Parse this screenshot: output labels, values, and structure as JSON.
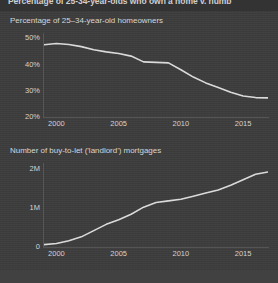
{
  "header": {
    "title": "Percentage of 25-34-year-olds who own a home v. numb"
  },
  "colors": {
    "background": "#3c3c3c",
    "header_band": "#333333",
    "line": "#dcdcdc",
    "axis": "#555555",
    "text": "#d4d4d4"
  },
  "chart_data": [
    {
      "type": "line",
      "title": "Percentage of 25–34-year-old homeowners",
      "xlabel": "",
      "ylabel": "",
      "xlim": [
        1999,
        2017
      ],
      "ylim": [
        20,
        52
      ],
      "xticks": [
        "2000",
        "2005",
        "2010",
        "2015"
      ],
      "xtick_values": [
        2000,
        2005,
        2010,
        2015
      ],
      "yticks": [
        "50%",
        "40%",
        "30%",
        "20%"
      ],
      "ytick_values": [
        50,
        40,
        30,
        20
      ],
      "grid": false,
      "legend": "none",
      "x": [
        1999,
        2000,
        2001,
        2002,
        2003,
        2004,
        2005,
        2006,
        2007,
        2008,
        2009,
        2010,
        2011,
        2012,
        2013,
        2014,
        2015,
        2016,
        2017
      ],
      "values": [
        47.5,
        48.0,
        47.6,
        46.8,
        45.6,
        44.8,
        44.2,
        43.2,
        41.0,
        40.8,
        40.6,
        38.0,
        35.2,
        33.0,
        31.2,
        29.4,
        28.0,
        27.4,
        27.3
      ]
    },
    {
      "type": "line",
      "title": "Number of buy-to-let ('landlord') mortgages",
      "xlabel": "",
      "ylabel": "",
      "xlim": [
        1999,
        2017
      ],
      "ylim": [
        0,
        2.15
      ],
      "xticks": [
        "2000",
        "2005",
        "2010",
        "2015"
      ],
      "xtick_values": [
        2000,
        2005,
        2010,
        2015
      ],
      "yticks": [
        "2M",
        "1M",
        "0"
      ],
      "ytick_values": [
        2,
        1,
        0
      ],
      "grid": false,
      "legend": "none",
      "x": [
        1999,
        2000,
        2001,
        2002,
        2003,
        2004,
        2005,
        2006,
        2007,
        2008,
        2009,
        2010,
        2011,
        2012,
        2013,
        2014,
        2015,
        2016,
        2017
      ],
      "values": [
        0.06,
        0.09,
        0.16,
        0.26,
        0.42,
        0.58,
        0.7,
        0.84,
        1.02,
        1.14,
        1.18,
        1.22,
        1.3,
        1.38,
        1.46,
        1.58,
        1.72,
        1.86,
        1.92
      ]
    }
  ]
}
